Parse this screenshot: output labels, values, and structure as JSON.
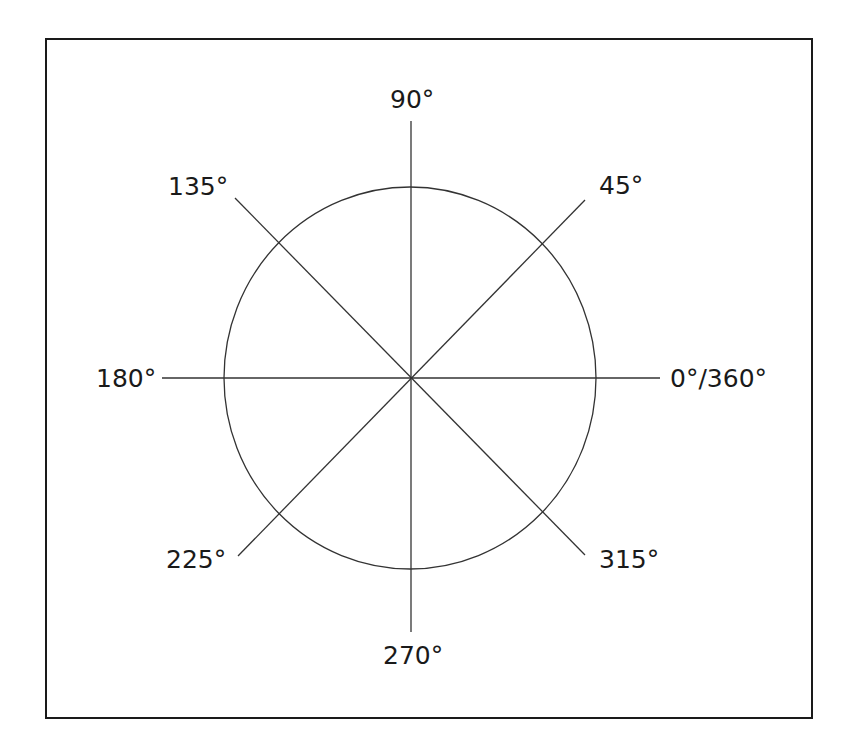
{
  "diagram": {
    "line_color": "#333333",
    "frame_color": "#1a1a1a",
    "center": {
      "x": 410,
      "y": 378
    },
    "circle": {
      "rx": 186,
      "ry": 191
    },
    "labels": {
      "deg0": "0°/360°",
      "deg45": "45°",
      "deg90": "90°",
      "deg135": "135°",
      "deg180": "180°",
      "deg225": "225°",
      "deg270": "270°",
      "deg315": "315°"
    }
  }
}
